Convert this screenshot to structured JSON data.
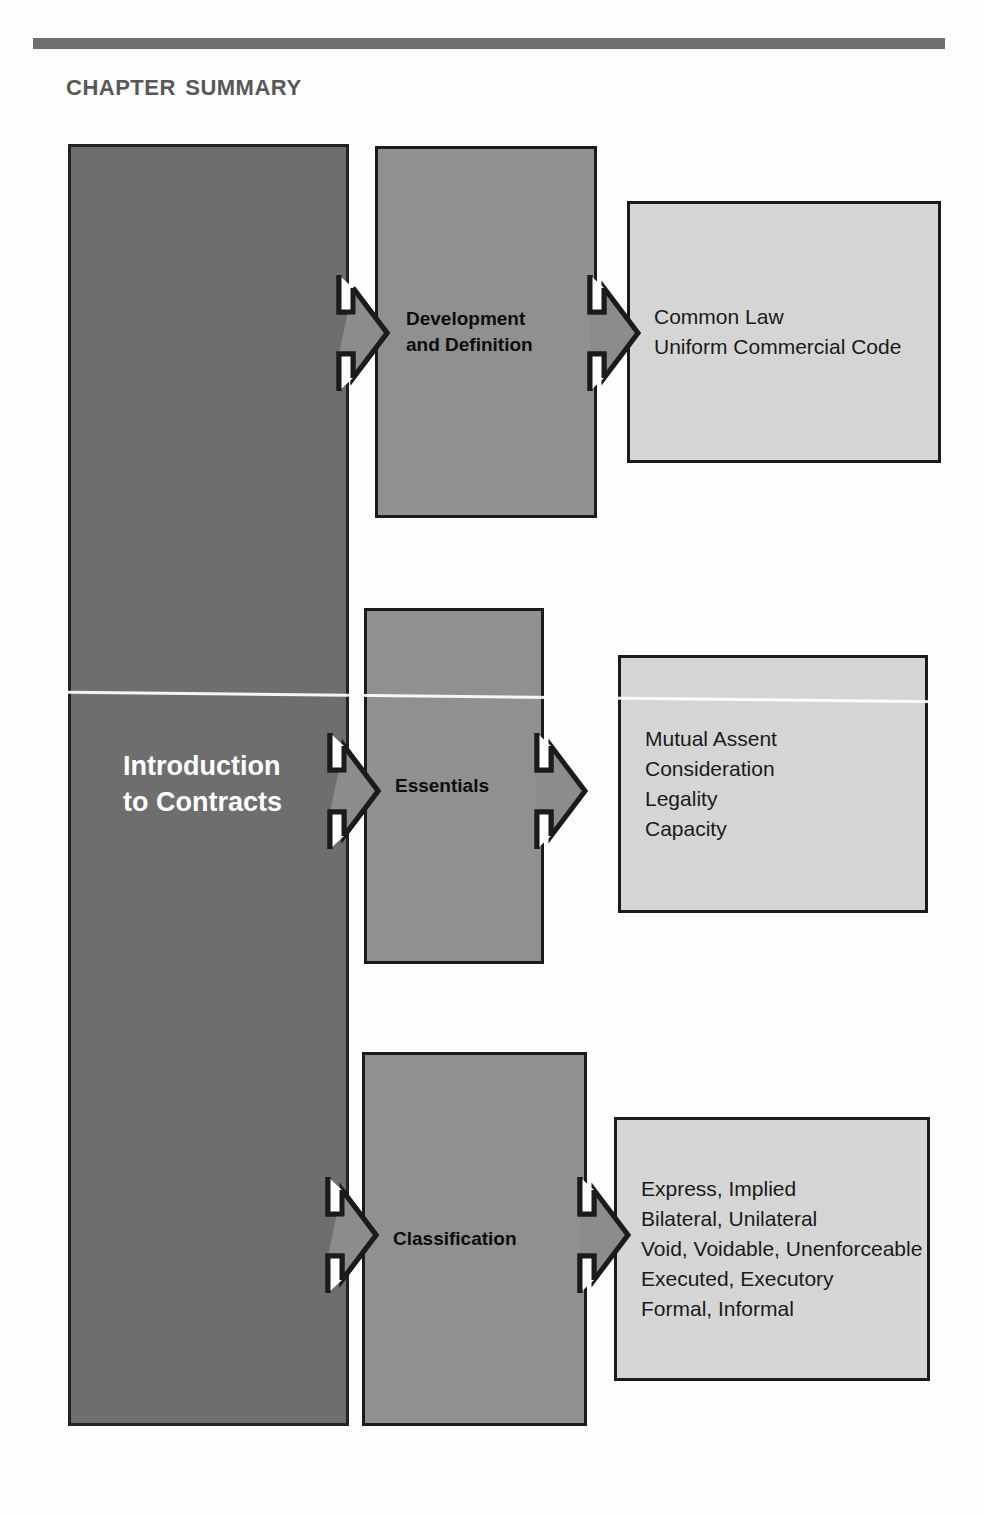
{
  "page": {
    "title": "Chapter Summary",
    "background_color": "#fdfdfd",
    "rule_bar_color": "#6f6f6f"
  },
  "colors": {
    "spine_fill": "#6e6e6e",
    "mid_fill": "#909090",
    "detail_fill": "#d5d5d5",
    "outline": "#1b1b1b",
    "spine_text": "#ffffff",
    "body_text": "#1a1a1a",
    "title_text": "#585858"
  },
  "diagram": {
    "root": {
      "label": "Introduction\nto Contracts"
    },
    "branches": [
      {
        "id": "development-and-definition",
        "category": "Development\nand Definition",
        "details": "Common Law\nUniform Commercial Code",
        "detail_items": [
          "Common Law",
          "Uniform Commercial Code"
        ]
      },
      {
        "id": "essentials",
        "category": "Essentials",
        "details": "Mutual Assent\nConsideration\nLegality\nCapacity",
        "detail_items": [
          "Mutual Assent",
          "Consideration",
          "Legality",
          "Capacity"
        ]
      },
      {
        "id": "classification",
        "category": "Classification",
        "details": "Express, Implied\nBilateral, Unilateral\nVoid, Voidable, Unenforceable\nExecuted, Executory\nFormal, Informal",
        "detail_items": [
          "Express, Implied",
          "Bilateral, Unilateral",
          "Void, Voidable, Unenforceable",
          "Executed, Executory",
          "Formal, Informal"
        ]
      }
    ],
    "arrows": [
      {
        "name": "arrow-root-to-development",
        "from": "root",
        "to": "development-and-definition",
        "direction": "right"
      },
      {
        "name": "arrow-development-to-details",
        "from": "development-and-definition",
        "to": "development-details",
        "direction": "right"
      },
      {
        "name": "arrow-root-to-essentials",
        "from": "root",
        "to": "essentials",
        "direction": "right"
      },
      {
        "name": "arrow-essentials-to-details",
        "from": "essentials",
        "to": "essentials-details",
        "direction": "right"
      },
      {
        "name": "arrow-root-to-classification",
        "from": "root",
        "to": "classification",
        "direction": "right"
      },
      {
        "name": "arrow-classification-to-details",
        "from": "classification",
        "to": "classification-details",
        "direction": "right"
      }
    ]
  }
}
